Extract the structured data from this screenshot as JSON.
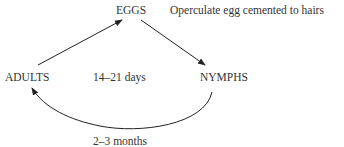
{
  "diagram": {
    "type": "life-cycle",
    "nodes": [
      {
        "id": "eggs",
        "label": "EGGS"
      },
      {
        "id": "nymphs",
        "label": "NYMPHS"
      },
      {
        "id": "adults",
        "label": "ADULTS"
      }
    ],
    "edges": [
      {
        "from": "adults",
        "to": "eggs"
      },
      {
        "from": "eggs",
        "to": "nymphs"
      },
      {
        "from": "nymphs",
        "to": "adults"
      }
    ],
    "annotations": {
      "egg_note": "Operculate egg cemented to hairs",
      "cycle_duration": "14–21 days",
      "nymph_to_adult_duration": "2–3 months"
    },
    "colors": {
      "line": "#222222",
      "text": "#333333",
      "background": "#ffffff"
    }
  }
}
